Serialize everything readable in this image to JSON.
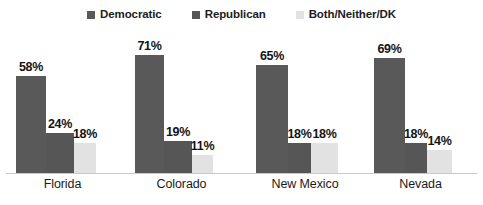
{
  "legend": {
    "items": [
      {
        "label": "Democratic",
        "color": "#595959",
        "key": "democratic"
      },
      {
        "label": "Republican",
        "color": "#565656",
        "key": "republican"
      },
      {
        "label": "Both/Neither/DK",
        "color": "#e2e2e2",
        "key": "both-neither-dk"
      }
    ]
  },
  "chart_data": {
    "type": "bar",
    "title": "",
    "xlabel": "",
    "ylabel": "",
    "ylim": [
      0,
      75
    ],
    "grid": false,
    "legend_position": "top-center",
    "value_suffix": "%",
    "categories": [
      "Florida",
      "Colorado",
      "New Mexico",
      "Nevada"
    ],
    "series": [
      {
        "name": "Democratic",
        "color": "#595959",
        "values": [
          58,
          71,
          65,
          69
        ],
        "labels": [
          "58%",
          "71%",
          "65%",
          "69%"
        ]
      },
      {
        "name": "Republican",
        "color": "#565656",
        "values": [
          24,
          19,
          18,
          18
        ],
        "labels": [
          "24%",
          "19%",
          "18%",
          "18%"
        ]
      },
      {
        "name": "Both/Neither/DK",
        "color": "#e2e2e2",
        "values": [
          18,
          11,
          18,
          14
        ],
        "labels": [
          "18%",
          "11%",
          "18%",
          "14%"
        ]
      }
    ]
  }
}
